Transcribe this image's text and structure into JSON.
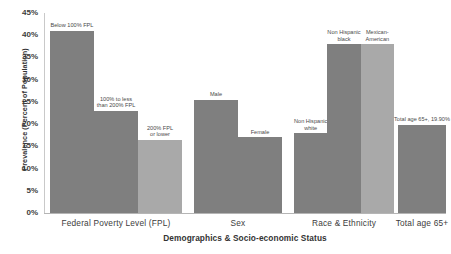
{
  "chart_data": {
    "type": "bar",
    "title": "",
    "xlabel": "Demographics & Socio-economic Status",
    "ylabel": "Prevalence (Percent of Population)",
    "ylim": [
      0,
      45
    ],
    "ytick_labels": [
      "45%",
      "40%",
      "35%",
      "30%",
      "25%",
      "20%",
      "15%",
      "10%",
      "5%",
      "0%"
    ],
    "ytick_values": [
      45,
      40,
      35,
      30,
      25,
      20,
      15,
      10,
      5,
      0
    ],
    "grid": false,
    "legend": "none",
    "categories": [
      "Federal Poverty Level (FPL)",
      "Sex",
      "Race & Ethnicity",
      "Total age 65+"
    ],
    "colors": {
      "dark_bar": "#7f7f7f",
      "light_bar": "#a9a9a9",
      "axis": "#c9c9c9",
      "text": "#3c3c3c"
    },
    "groups": [
      {
        "name": "Federal Poverty Level (FPL)",
        "bars": [
          {
            "label": "Below 100% FPL",
            "value": 41.0,
            "shade": "dark"
          },
          {
            "label": "100% to less\nthan 200% FPL",
            "value": 23.0,
            "shade": "dark"
          },
          {
            "label": "200% FPL\nor lower",
            "value": 16.5,
            "shade": "light"
          }
        ]
      },
      {
        "name": "Sex",
        "bars": [
          {
            "label": "Male",
            "value": 25.5,
            "shade": "dark"
          },
          {
            "label": "Female",
            "value": 17.0,
            "shade": "dark"
          }
        ]
      },
      {
        "name": "Race & Ethnicity",
        "bars": [
          {
            "label": "Non Hispanic\nwhite",
            "value": 18.0,
            "shade": "dark"
          },
          {
            "label": "Non Hispanic\nblack",
            "value": 38.0,
            "shade": "dark"
          },
          {
            "label": "Mexican-\nAmerican",
            "value": 38.0,
            "shade": "light"
          }
        ]
      },
      {
        "name": "Total age 65+",
        "bars": [
          {
            "label": "Total age 65+, 19.90%",
            "value": 19.9,
            "shade": "dark"
          }
        ]
      }
    ]
  },
  "layout": {
    "group_spans": [
      {
        "left": 6,
        "width": 132
      },
      {
        "left": 150,
        "width": 88
      },
      {
        "left": 250,
        "width": 100
      },
      {
        "left": 354,
        "width": 48
      }
    ],
    "bar_width": 29,
    "bar_gap": 1
  }
}
